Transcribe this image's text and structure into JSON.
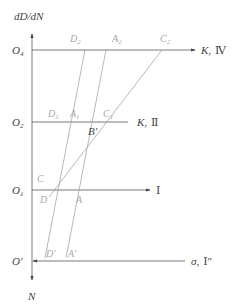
{
  "figure": {
    "axis_y_label": "dD/dN",
    "axis_y_bottom_label": "N",
    "origins": {
      "o4": {
        "base": "O",
        "sub": "4",
        "y": 50
      },
      "o2": {
        "base": "O",
        "sub": "2",
        "y": 122
      },
      "o1": {
        "base": "O",
        "sub": "1",
        "y": 190
      },
      "oprime": {
        "base": "O'",
        "y": 261
      }
    },
    "horizontal_lines": [
      {
        "name": "line-IV",
        "label_k": "K,",
        "label_roman": "Ⅳ",
        "y": 50,
        "x_end": 195
      },
      {
        "name": "line-II",
        "label_k": "K,",
        "label_roman": "Ⅱ",
        "y": 122,
        "x_end": 128
      },
      {
        "name": "line-I",
        "label_k": "",
        "label_roman": "Ⅰ",
        "y": 190,
        "x_end": 150
      },
      {
        "name": "line-sigma",
        "label_k": "σ,",
        "label_roman": "Ⅰ″",
        "y": 261,
        "x_end": 185
      }
    ],
    "points": {
      "D2": {
        "base": "D",
        "sub": "2"
      },
      "A2": {
        "base": "A",
        "sub": "2"
      },
      "C2": {
        "base": "C",
        "sub": "2"
      },
      "D1": {
        "base": "D",
        "sub": "1"
      },
      "A1": {
        "base": "A",
        "sub": "1"
      },
      "C1": {
        "base": "C",
        "sub": "1"
      },
      "Bp": {
        "base": "B'"
      },
      "C": {
        "base": "C"
      },
      "D": {
        "base": "D"
      },
      "A": {
        "base": "A"
      },
      "Dp": {
        "base": "D'"
      },
      "Ap": {
        "base": "A'"
      }
    },
    "colors": {
      "axis": "#555555",
      "guide_lines": "#999999",
      "light_labels": "#a8a8a8",
      "dark_labels": "#444444"
    }
  }
}
